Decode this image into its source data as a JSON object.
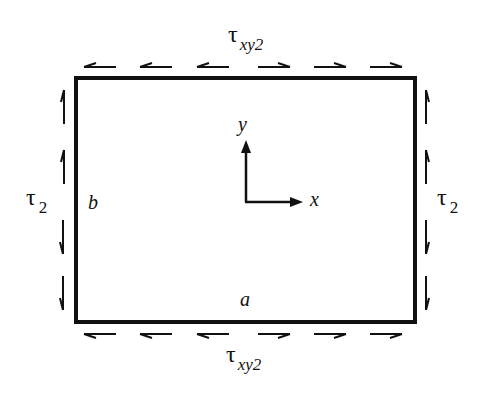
{
  "diagram": {
    "labels": {
      "top_shear": {
        "symbol": "τ",
        "subscript": "xy2"
      },
      "bottom_shear": {
        "symbol": "τ",
        "subscript": "xy2"
      },
      "left_shear": {
        "symbol": "τ",
        "subscript": "2"
      },
      "right_shear": {
        "symbol": "τ",
        "subscript": "2"
      },
      "side_b": "b",
      "side_a": "a",
      "axis_x": "x",
      "axis_y": "y"
    },
    "edges": {
      "top_arrows": [
        "left",
        "left",
        "left",
        "right",
        "right",
        "right"
      ],
      "bottom_arrows": [
        "left",
        "left",
        "left",
        "right",
        "right",
        "right"
      ],
      "left_arrows": [
        "up",
        "up",
        "down",
        "down"
      ],
      "right_arrows": [
        "up",
        "up",
        "down",
        "down"
      ]
    },
    "colors": {
      "stroke": "#111111",
      "background": "#ffffff"
    }
  }
}
